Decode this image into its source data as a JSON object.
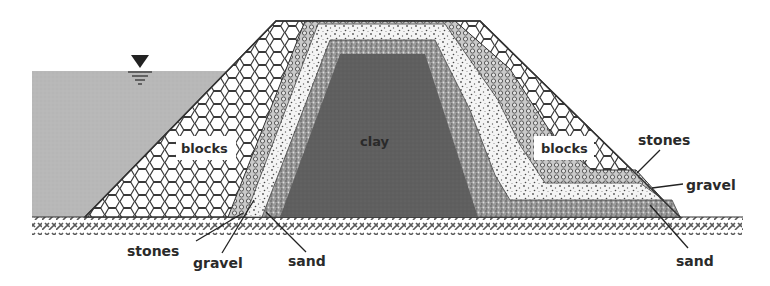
{
  "diagram": {
    "type": "cross-section",
    "water_level_symbol": "water-level-triangle",
    "labels": {
      "clay": "clay",
      "blocks_left": "blocks",
      "blocks_right": "blocks",
      "stones_left": "stones",
      "gravel_left": "gravel",
      "sand_left": "sand",
      "stones_right": "stones",
      "gravel_right": "gravel",
      "sand_right": "sand"
    },
    "layers": [
      {
        "name": "blocks",
        "pattern": "hexagons",
        "color": "#ffffff"
      },
      {
        "name": "stones",
        "pattern": "small-rings",
        "color": "#bdbdbd"
      },
      {
        "name": "gravel",
        "pattern": "speckle",
        "color": "#f2f2f2"
      },
      {
        "name": "sand",
        "pattern": "dense-speckle",
        "color": "#8c8c8c"
      },
      {
        "name": "clay",
        "pattern": "solid",
        "color": "#5e5e5e"
      }
    ],
    "colors": {
      "water": "#b9b9b9",
      "outline": "#333333",
      "ground_hatch": "#555555"
    }
  }
}
